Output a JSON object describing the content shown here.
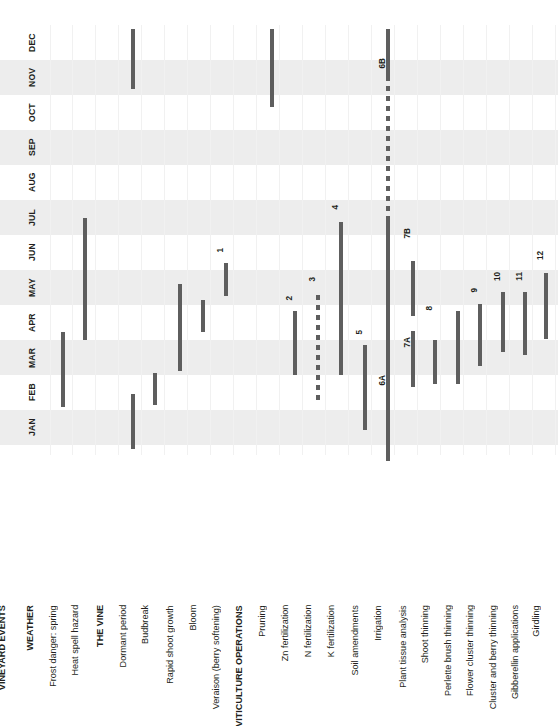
{
  "chart_data": {
    "type": "table",
    "title": "VINEYARD EVENTS",
    "xlabel": "",
    "ylabel": "",
    "grid": true,
    "legend": "none",
    "months": [
      "JAN",
      "FEB",
      "MAR",
      "APR",
      "MAY",
      "JUN",
      "JUL",
      "AUG",
      "SEP",
      "OCT",
      "NOV",
      "DEC"
    ],
    "month_axis_direction": "bottom-to-top",
    "categories": [
      "VINEYARD EVENTS",
      "WEATHER",
      "Frost danger: spring",
      "Heat spell hazard",
      "THE VINE",
      "Dormant period",
      "Budbreak",
      "Rapid shoot growth",
      "Bloom",
      "Veraison (berry softening)",
      "VITICULTURE OPERATIONS",
      "Pruning",
      "Zn fertilization",
      "N fertilization",
      "K fertilization",
      "Soil amendments",
      "Irrigation",
      "Plant tissue analysis",
      "Shoot thinning",
      "Perlette brush thinning",
      "Flower cluster thinning",
      "Cluster and berry thinning",
      "Gibberellin applications",
      "Girdling"
    ],
    "section_headers": [
      "VINEYARD EVENTS",
      "WEATHER",
      "THE VINE",
      "VITICULTURE OPERATIONS"
    ],
    "bars": [
      {
        "label": "Frost danger: spring",
        "tag": "",
        "style": "solid",
        "start_month": "FEB",
        "end_month": "MAR",
        "x": 63,
        "top": 332,
        "height": 75
      },
      {
        "label": "Heat spell hazard",
        "tag": "",
        "style": "solid",
        "start_month": "MAR",
        "end_month": "JUN",
        "x": 85,
        "top": 218,
        "height": 122
      },
      {
        "label": "Dormant period",
        "tag": "",
        "style": "solid",
        "start_month": "DEC",
        "end_month": "JAN",
        "x": 133,
        "top": 29,
        "height": 60
      },
      {
        "label": "Dormant period",
        "tag": "",
        "style": "solid",
        "start_month": "JAN",
        "end_month": "FEB",
        "x": 133,
        "top": 394,
        "height": 55
      },
      {
        "label": "Budbreak",
        "tag": "",
        "style": "solid",
        "start_month": "FEB",
        "end_month": "FEB",
        "x": 155,
        "top": 373,
        "height": 32
      },
      {
        "label": "Rapid shoot growth",
        "tag": "",
        "style": "solid",
        "start_month": "MAR",
        "end_month": "MAY",
        "x": 180,
        "top": 284,
        "height": 87
      },
      {
        "label": "Bloom",
        "tag": "",
        "style": "solid",
        "start_month": "APR",
        "end_month": "MAY",
        "x": 203,
        "top": 300,
        "height": 32
      },
      {
        "label": "Veraison (berry softening)",
        "tag": "1",
        "style": "solid",
        "start_month": "APR",
        "end_month": "MAY",
        "x": 226,
        "top": 263,
        "height": 33
      },
      {
        "label": "Pruning",
        "tag": "",
        "style": "solid",
        "start_month": "NOV",
        "end_month": "DEC",
        "x": 272,
        "top": 29,
        "height": 78
      },
      {
        "label": "Zn fertilization",
        "tag": "2",
        "style": "solid",
        "start_month": "MAR",
        "end_month": "MAY",
        "x": 295,
        "top": 311,
        "height": 64
      },
      {
        "label": "N fertilization",
        "tag": "3",
        "style": "dashed",
        "start_month": "FEB",
        "end_month": "MAY",
        "x": 318,
        "top": 295,
        "height": 110
      },
      {
        "label": "K fertilization",
        "tag": "4",
        "style": "solid",
        "start_month": "MAR",
        "end_month": "JUL",
        "x": 341,
        "top": 222,
        "height": 153
      },
      {
        "label": "Soil amendments",
        "tag": "5",
        "style": "solid",
        "start_month": "JAN",
        "end_month": "MAR",
        "x": 365,
        "top": 345,
        "height": 85
      },
      {
        "label": "Irrigation",
        "tag": "6A",
        "style": "solid",
        "start_month": "JAN",
        "end_month": "JUL",
        "x": 388,
        "top": 218,
        "height": 243
      },
      {
        "label": "Irrigation",
        "tag": "6B",
        "style": "dashed",
        "start_month": "JUL",
        "end_month": "DEC",
        "x": 388,
        "top": 56,
        "height": 166
      },
      {
        "label": "Pruning (Dec)",
        "tag": "",
        "style": "solid",
        "start_month": "DEC",
        "end_month": "DEC",
        "x": 388,
        "top": 29,
        "height": 52
      },
      {
        "label": "Plant tissue analysis",
        "tag": "7A",
        "style": "solid",
        "start_month": "MAR",
        "end_month": "APR",
        "x": 413,
        "top": 331,
        "height": 56
      },
      {
        "label": "Plant tissue analysis",
        "tag": "7B",
        "style": "solid",
        "start_month": "MAY",
        "end_month": "JUN",
        "x": 413,
        "top": 261,
        "height": 55
      },
      {
        "label": "Shoot thinning",
        "tag": "8",
        "style": "solid",
        "start_month": "MAR",
        "end_month": "APR",
        "x": 435,
        "top": 340,
        "height": 44
      },
      {
        "label": "Perlette brush thinning",
        "tag": "",
        "style": "solid",
        "start_month": "MAR",
        "end_month": "APR",
        "x": 458,
        "top": 311,
        "height": 73
      },
      {
        "label": "Flower cluster thinning",
        "tag": "9",
        "style": "solid",
        "start_month": "APR",
        "end_month": "MAY",
        "x": 480,
        "top": 304,
        "height": 62
      },
      {
        "label": "Cluster and berry thinning",
        "tag": "10",
        "style": "solid",
        "start_month": "APR",
        "end_month": "MAY",
        "x": 503,
        "top": 292,
        "height": 60
      },
      {
        "label": "Gibberellin applications",
        "tag": "11",
        "style": "solid",
        "start_month": "APR",
        "end_month": "MAY",
        "x": 525,
        "top": 292,
        "height": 63
      },
      {
        "label": "Girdling",
        "tag": "12",
        "style": "solid",
        "start_month": "APR",
        "end_month": "MAY",
        "x": 546,
        "top": 273,
        "height": 66
      }
    ]
  },
  "months": [
    {
      "name": "DEC",
      "top": 25,
      "shaded": false
    },
    {
      "name": "NOV",
      "top": 60,
      "shaded": true
    },
    {
      "name": "OCT",
      "top": 95,
      "shaded": false
    },
    {
      "name": "SEP",
      "top": 130,
      "shaded": true
    },
    {
      "name": "AUG",
      "top": 165,
      "shaded": false
    },
    {
      "name": "JUL",
      "top": 200,
      "shaded": true
    },
    {
      "name": "JUN",
      "top": 235,
      "shaded": false
    },
    {
      "name": "MAY",
      "top": 270,
      "shaded": true
    },
    {
      "name": "APR",
      "top": 305,
      "shaded": false
    },
    {
      "name": "MAR",
      "top": 340,
      "shaded": true
    },
    {
      "name": "FEB",
      "top": 375,
      "shaded": false
    },
    {
      "name": "JAN",
      "top": 410,
      "shaded": true
    }
  ],
  "axis_labels": [
    {
      "text": "VINEYARD EVENTS",
      "x": 12,
      "head": true
    },
    {
      "text": "WEATHER",
      "x": 40,
      "head": true
    },
    {
      "text": "Frost danger: spring",
      "x": 63,
      "head": false
    },
    {
      "text": "Heat spell hazard",
      "x": 85,
      "head": false
    },
    {
      "text": "THE VINE",
      "x": 110,
      "head": true
    },
    {
      "text": "Dormant period",
      "x": 133,
      "head": false
    },
    {
      "text": "Budbreak",
      "x": 155,
      "head": false
    },
    {
      "text": "Rapid shoot growth",
      "x": 180,
      "head": false
    },
    {
      "text": "Bloom",
      "x": 203,
      "head": false
    },
    {
      "text": "Veraison (berry softening)",
      "x": 226,
      "head": false
    },
    {
      "text": "VITICULTURE OPERATIONS",
      "x": 249,
      "head": true
    },
    {
      "text": "Pruning",
      "x": 272,
      "head": false
    },
    {
      "text": "Zn fertilization",
      "x": 295,
      "head": false
    },
    {
      "text": "N fertilization",
      "x": 318,
      "head": false
    },
    {
      "text": "K fertilization",
      "x": 341,
      "head": false
    },
    {
      "text": "Soil amendments",
      "x": 365,
      "head": false
    },
    {
      "text": "Irrigation",
      "x": 388,
      "head": false
    },
    {
      "text": "Plant tissue analysis",
      "x": 413,
      "head": false
    },
    {
      "text": "Shoot thinning",
      "x": 435,
      "head": false
    },
    {
      "text": "Perlette brush thinning",
      "x": 458,
      "head": false
    },
    {
      "text": "Flower cluster thinning",
      "x": 480,
      "head": false
    },
    {
      "text": "Cluster and berry thinning",
      "x": 503,
      "head": false
    },
    {
      "text": "Gibberellin applications",
      "x": 525,
      "head": false
    },
    {
      "text": "Girdling",
      "x": 546,
      "head": false
    }
  ],
  "bar_tags": [
    {
      "text": "1",
      "x": 226,
      "top": 248
    },
    {
      "text": "2",
      "x": 295,
      "top": 296
    },
    {
      "text": "3",
      "x": 318,
      "top": 277
    },
    {
      "text": "4",
      "x": 341,
      "top": 205
    },
    {
      "text": "5",
      "x": 365,
      "top": 330
    },
    {
      "text": "6A",
      "x": 388,
      "top": 375
    },
    {
      "text": "6B",
      "x": 388,
      "top": 58
    },
    {
      "text": "7A",
      "x": 413,
      "top": 337
    },
    {
      "text": "7B",
      "x": 413,
      "top": 228
    },
    {
      "text": "8",
      "x": 435,
      "top": 306
    },
    {
      "text": "9",
      "x": 480,
      "top": 288
    },
    {
      "text": "10",
      "x": 503,
      "top": 272
    },
    {
      "text": "11",
      "x": 525,
      "top": 272
    },
    {
      "text": "12",
      "x": 546,
      "top": 251
    }
  ],
  "gridlines_x": [
    50,
    72,
    95,
    118,
    141,
    164,
    187,
    210,
    233,
    256,
    279,
    302,
    325,
    348,
    371,
    394,
    417,
    440,
    463,
    486,
    509,
    532,
    555
  ],
  "colors": {
    "band_shaded": "#ededed",
    "band_plain": "#ffffff",
    "bar": "#5e5e5e",
    "text": "#231f20",
    "gridline": "#f1f1f1"
  }
}
